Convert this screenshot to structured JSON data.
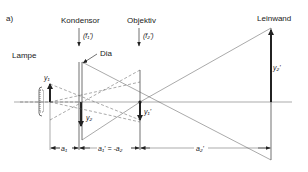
{
  "figure": {
    "label": "a)",
    "elements": {
      "lamp": "Lampe",
      "condenser": "Kondensor",
      "condenser_focal": "(f₁')",
      "slide": "Dia",
      "objective": "Objektiv",
      "objective_focal": "(f₂')",
      "screen": "Leinwand"
    },
    "quantities": {
      "y1": "y₁",
      "y2": "y₂",
      "y1_prime": "y₁'",
      "y2_prime": "y₂'"
    },
    "dimensions": {
      "a1": "a₁",
      "a1p_eq": "a₁' = -a₂",
      "a2p": "a₂'"
    },
    "colors": {
      "line": "#333333",
      "background": "#ffffff"
    }
  }
}
